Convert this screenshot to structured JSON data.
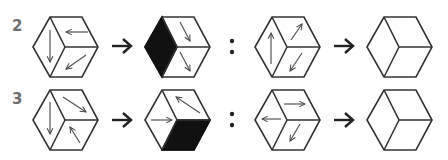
{
  "puzzle": {
    "rows": [
      {
        "label": "2",
        "left_pair": {
          "source_cube": {
            "left_face": {
              "fill": "white",
              "arrow": "down"
            },
            "top_face": {
              "fill": "white",
              "arrow": "left"
            },
            "bottom_face": {
              "fill": "white",
              "arrow": "down-left"
            }
          },
          "result_cube": {
            "left_face": {
              "fill": "black",
              "arrow": "none"
            },
            "top_face": {
              "fill": "white",
              "arrow": "down-right"
            },
            "bottom_face": {
              "fill": "white",
              "arrow": "down-right"
            }
          }
        },
        "separator": ":",
        "right_pair": {
          "source_cube": {
            "left_face": {
              "fill": "white",
              "arrow": "up"
            },
            "top_face": {
              "fill": "white",
              "arrow": "up-right"
            },
            "bottom_face": {
              "fill": "white",
              "arrow": "down-left"
            }
          },
          "result_cube": {
            "left_face": {
              "fill": "white",
              "arrow": "none"
            },
            "top_face": {
              "fill": "white",
              "arrow": "none"
            },
            "bottom_face": {
              "fill": "white",
              "arrow": "none"
            }
          }
        }
      },
      {
        "label": "3",
        "left_pair": {
          "source_cube": {
            "left_face": {
              "fill": "white",
              "arrow": "down"
            },
            "top_face": {
              "fill": "white",
              "arrow": "down-right"
            },
            "bottom_face": {
              "fill": "white",
              "arrow": "up-left"
            }
          },
          "result_cube": {
            "left_face": {
              "fill": "white",
              "arrow": "right"
            },
            "top_face": {
              "fill": "white",
              "arrow": "up-left"
            },
            "bottom_face": {
              "fill": "black",
              "arrow": "none"
            }
          }
        },
        "separator": ":",
        "right_pair": {
          "source_cube": {
            "left_face": {
              "fill": "white",
              "arrow": "left"
            },
            "top_face": {
              "fill": "white",
              "arrow": "right"
            },
            "bottom_face": {
              "fill": "white",
              "arrow": "down-left"
            }
          },
          "result_cube": {
            "left_face": {
              "fill": "white",
              "arrow": "none"
            },
            "top_face": {
              "fill": "white",
              "arrow": "none"
            },
            "bottom_face": {
              "fill": "white",
              "arrow": "none"
            }
          }
        }
      }
    ],
    "transform_arrow": "right-arrow",
    "colors": {
      "stroke": "#333333",
      "fill_dark": "#111111",
      "label": "#6e6e6e"
    }
  }
}
